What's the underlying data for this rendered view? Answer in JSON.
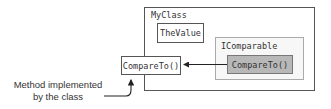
{
  "diagram": {
    "outer_class": {
      "label": "MyClass"
    },
    "field": {
      "label": "TheValue"
    },
    "interface": {
      "label": "IComparable",
      "method": {
        "label": "CompareTo()"
      }
    },
    "class_method": {
      "label": "CompareTo()"
    },
    "callout": {
      "line1": "Method implemented",
      "line2": "by the class"
    },
    "edges": [
      {
        "from": "interface.method",
        "to": "class_method",
        "style": "arrow"
      },
      {
        "from": "callout",
        "to": "class_method",
        "style": "curved-arrow"
      }
    ]
  },
  "colors": {
    "outer_border": "#555555",
    "interface_border": "#aaaaaa",
    "interface_fill": "#f7f7f7",
    "method_fill": "#b8b8b8",
    "text": "#333333"
  }
}
